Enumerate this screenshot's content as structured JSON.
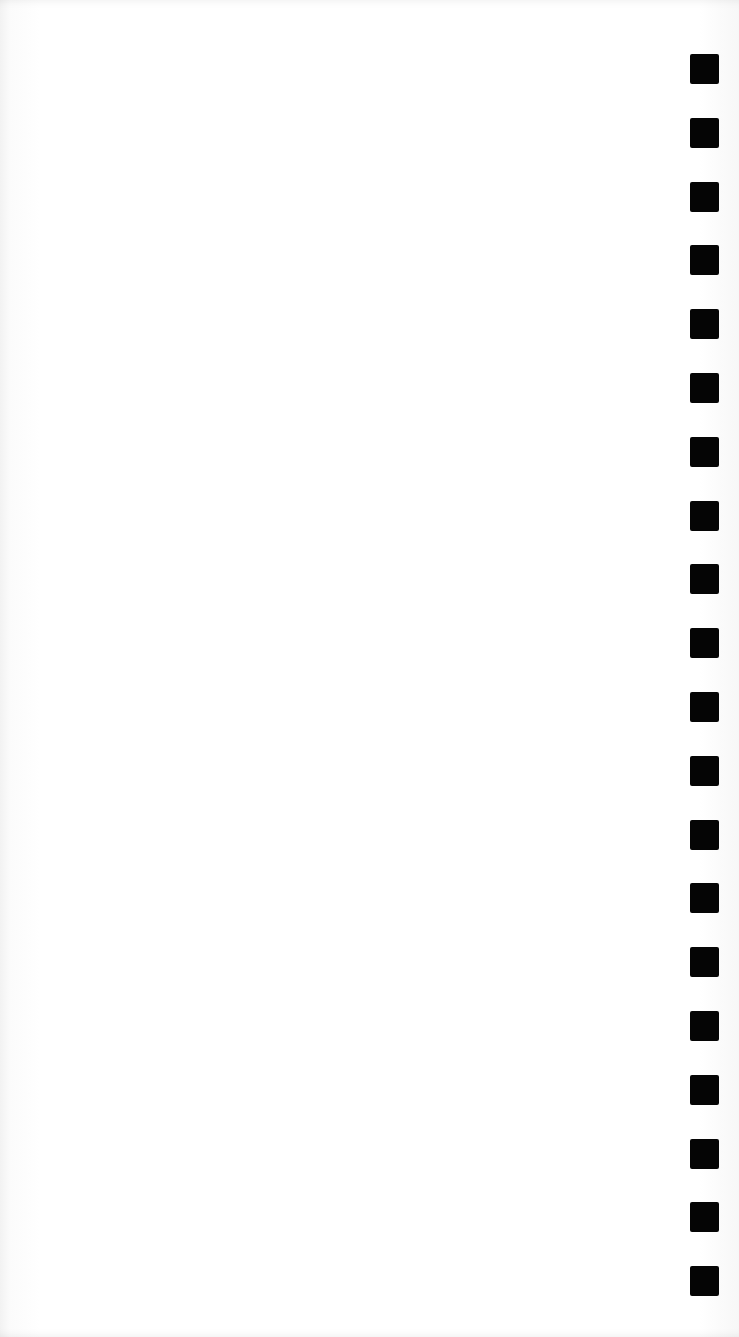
{
  "page": {
    "background": "#ffffff",
    "content_text": ""
  },
  "margin_marks": {
    "count": 20,
    "color": "#050505",
    "shape": "square",
    "x": 690,
    "first_y": 54,
    "pitch": 63.8,
    "width": 29,
    "height": 30
  }
}
